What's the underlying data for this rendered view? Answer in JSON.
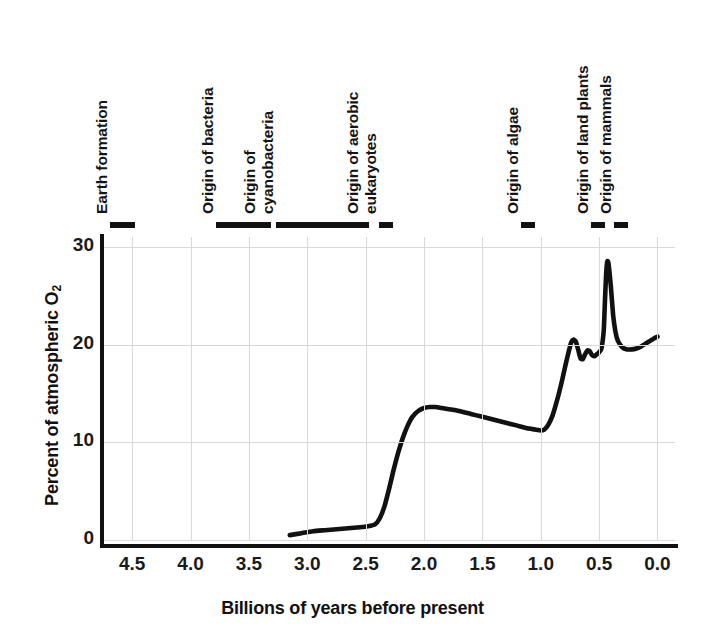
{
  "chart_data": {
    "type": "line",
    "title": "",
    "xlabel": "Billions of years before present",
    "ylabel_html": "Percent of atmospheric O<sub>2</sub>",
    "ylabel": "Percent of atmospheric O2",
    "xlim": [
      4.75,
      -0.15
    ],
    "ylim": [
      0,
      31
    ],
    "x_reversed": true,
    "grid": true,
    "legend": "none",
    "x_ticks": [
      "4.5",
      "4.0",
      "3.5",
      "3.0",
      "2.5",
      "2.0",
      "1.5",
      "1.0",
      "0.5",
      "0.0"
    ],
    "x_tick_values": [
      4.5,
      4.0,
      3.5,
      3.0,
      2.5,
      2.0,
      1.5,
      1.0,
      0.5,
      0.0
    ],
    "y_ticks": [
      "0",
      "10",
      "20",
      "30"
    ],
    "y_tick_values": [
      0,
      10,
      20,
      30
    ],
    "series": [
      {
        "name": "Atmospheric oxygen",
        "color": "#111111",
        "x": [
          3.15,
          3.05,
          2.95,
          2.85,
          2.75,
          2.65,
          2.55,
          2.48,
          2.42,
          2.38,
          2.34,
          2.3,
          2.26,
          2.22,
          2.18,
          2.14,
          2.1,
          2.05,
          2.0,
          1.95,
          1.9,
          1.85,
          1.8,
          1.7,
          1.6,
          1.5,
          1.4,
          1.3,
          1.2,
          1.1,
          1.05,
          1.0,
          0.97,
          0.94,
          0.9,
          0.86,
          0.82,
          0.79,
          0.76,
          0.74,
          0.72,
          0.7,
          0.68,
          0.66,
          0.64,
          0.62,
          0.6,
          0.58,
          0.56,
          0.54,
          0.52,
          0.5,
          0.48,
          0.46,
          0.45,
          0.44,
          0.43,
          0.42,
          0.4,
          0.38,
          0.36,
          0.34,
          0.3,
          0.26,
          0.22,
          0.18,
          0.14,
          0.1,
          0.06,
          0.02,
          0.0
        ],
        "y": [
          0.5,
          0.7,
          0.9,
          1.0,
          1.1,
          1.2,
          1.3,
          1.4,
          1.6,
          2.2,
          3.4,
          5.2,
          7.2,
          9.0,
          10.5,
          11.7,
          12.6,
          13.2,
          13.5,
          13.6,
          13.6,
          13.5,
          13.4,
          13.2,
          12.9,
          12.6,
          12.3,
          12.0,
          11.7,
          11.4,
          11.3,
          11.2,
          11.3,
          11.7,
          12.7,
          14.3,
          16.2,
          17.8,
          19.3,
          20.2,
          20.5,
          20.3,
          19.5,
          18.6,
          18.5,
          19.0,
          19.4,
          19.3,
          18.9,
          18.8,
          19.0,
          19.2,
          19.6,
          21.5,
          24.5,
          27.2,
          28.5,
          28.3,
          26.0,
          23.0,
          21.3,
          20.4,
          19.7,
          19.5,
          19.5,
          19.6,
          19.8,
          20.1,
          20.4,
          20.7,
          20.8
        ],
        "max_value": 28.5,
        "max_value_at": 0.43,
        "min_value": 0.5,
        "min_value_at": 3.15,
        "present_value": 20.8
      }
    ],
    "events": [
      {
        "id": "earth-formation",
        "label": "Earth formation",
        "label_lines": [
          "Earth formation"
        ],
        "start_ga": 4.6,
        "end_ga": 4.4,
        "bar_left_px": 110,
        "bar_width_px": 25
      },
      {
        "id": "origin-of-bacteria",
        "label": "Origin of bacteria",
        "label_lines": [
          "Origin of bacteria"
        ],
        "start_ga": 3.7,
        "end_ga": 3.25,
        "bar_left_px": 216,
        "bar_width_px": 55
      },
      {
        "id": "origin-of-cyanobacteria",
        "label": "Origin of cyanobacteria",
        "label_lines": [
          "Origin of",
          "cyanobacteria"
        ],
        "start_ga": 3.2,
        "end_ga": 2.45,
        "bar_left_px": 276,
        "bar_width_px": 93
      },
      {
        "id": "origin-of-aerobic-eukaryotes",
        "label": "Origin of aerobic eukaryotes",
        "label_lines": [
          "Origin of aerobic",
          "eukaryotes"
        ],
        "start_ga": 2.3,
        "end_ga": 2.2,
        "bar_left_px": 379,
        "bar_width_px": 14
      },
      {
        "id": "origin-of-algae",
        "label": "Origin of algae",
        "label_lines": [
          "Origin of algae"
        ],
        "start_ga": 1.05,
        "end_ga": 0.95,
        "bar_left_px": 521,
        "bar_width_px": 14
      },
      {
        "id": "origin-of-land-plants",
        "label": "Origin of land plants",
        "label_lines": [
          "Origin of land plants"
        ],
        "start_ga": 0.48,
        "end_ga": 0.42,
        "bar_left_px": 591,
        "bar_width_px": 14
      },
      {
        "id": "origin-of-mammals",
        "label": "Origin of mammals",
        "label_lines": [
          "Origin of mammals"
        ],
        "start_ga": 0.28,
        "end_ga": 0.22,
        "bar_left_px": 614,
        "bar_width_px": 14
      }
    ],
    "colors": {
      "curve": "#111111",
      "axis": "#111111",
      "grid": "#d8d8d8",
      "text": "#1a1a1a",
      "background": "#ffffff"
    }
  }
}
